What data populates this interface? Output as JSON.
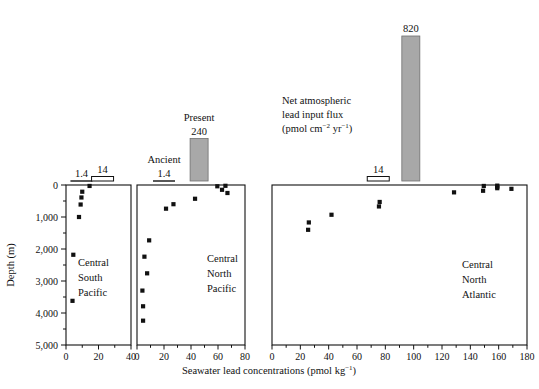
{
  "figure": {
    "y_axis_label": "Depth (m)",
    "x_axis_label_main": "Seawater lead concentrations (pmol kg",
    "x_axis_label_sup": "−1",
    "x_axis_label_tail": ")",
    "flux_caption_line1": "Net atmospheric",
    "flux_caption_line2": "lead input flux",
    "flux_caption_line3_pre": "(pmol cm",
    "flux_caption_sup1": "−2",
    "flux_caption_line3_mid": " yr",
    "flux_caption_sup2": "−1",
    "flux_caption_line3_end": ")",
    "legend_present": "Present",
    "legend_ancient": "Ancient",
    "depth_ticks": [
      "0",
      "1,000",
      "2,000",
      "3,000",
      "4,000",
      "5,000"
    ],
    "depth_values": [
      0,
      1000,
      2000,
      3000,
      4000,
      5000
    ],
    "depth_minor_values": [
      500,
      1500,
      2500,
      3500,
      4500
    ],
    "colors": {
      "bar_fill_present": "#a8a8a8",
      "bar_fill_ancient": "#ffffff",
      "axis": "#111111",
      "marker": "#111111",
      "background": "#ffffff"
    }
  },
  "chart_data": {
    "type": "scatter",
    "title": "",
    "ylabel": "Depth (m)",
    "xlabel": "Seawater lead concentrations (pmol kg−1)",
    "ylim": [
      0,
      5000
    ],
    "y_inverted": true,
    "grid": false,
    "legend": "none",
    "panels": [
      {
        "name": "Central South Pacific",
        "label_lines": [
          "Central",
          "South",
          "Pacific"
        ],
        "xlim": [
          0,
          40
        ],
        "xticks": [
          0,
          20,
          40
        ],
        "xtick_labels": [
          "0",
          "20",
          "40"
        ],
        "x_minor": [
          10,
          30
        ],
        "points": [
          {
            "x": 14.5,
            "y": 30
          },
          {
            "x": 10.0,
            "y": 210
          },
          {
            "x": 9.5,
            "y": 390
          },
          {
            "x": 9.0,
            "y": 610
          },
          {
            "x": 8.0,
            "y": 1000
          },
          {
            "x": 4.5,
            "y": 2180
          },
          {
            "x": 4.0,
            "y": 3620
          }
        ],
        "flux_bars": [
          {
            "label": "1.4",
            "value": 1.4,
            "style": "line",
            "x_center": 9.5
          },
          {
            "label": "14",
            "value": 14,
            "style": "hatched",
            "x_center": 22.5
          }
        ]
      },
      {
        "name": "Central North Pacific",
        "label_lines": [
          "Central",
          "North",
          "Pacific"
        ],
        "xlim": [
          0,
          80
        ],
        "xticks": [
          0,
          20,
          40,
          60,
          80
        ],
        "xtick_labels": [
          "0",
          "20",
          "40",
          "60",
          "80"
        ],
        "x_minor": [
          10,
          30,
          50,
          70
        ],
        "points": [
          {
            "x": 59.5,
            "y": 40
          },
          {
            "x": 65.5,
            "y": 25
          },
          {
            "x": 63.0,
            "y": 150
          },
          {
            "x": 67.0,
            "y": 250
          },
          {
            "x": 43.0,
            "y": 430
          },
          {
            "x": 27.0,
            "y": 600
          },
          {
            "x": 21.5,
            "y": 740
          },
          {
            "x": 9.0,
            "y": 1730
          },
          {
            "x": 5.5,
            "y": 2240
          },
          {
            "x": 7.5,
            "y": 2760
          },
          {
            "x": 4.0,
            "y": 3300
          },
          {
            "x": 4.5,
            "y": 3790
          },
          {
            "x": 4.5,
            "y": 4240
          }
        ],
        "flux_bars": [
          {
            "label": "1.4",
            "value": 1.4,
            "style": "line",
            "x_center": 20.0,
            "caption": "Ancient"
          },
          {
            "label": "240",
            "value": 240,
            "style": "filled",
            "x_center": 46.0,
            "caption": "Present"
          }
        ]
      },
      {
        "name": "Central North Atlantic",
        "label_lines": [
          "Central",
          "North",
          "Atlantic"
        ],
        "xlim": [
          0,
          180
        ],
        "xticks": [
          0,
          20,
          40,
          60,
          80,
          100,
          120,
          140,
          160,
          180
        ],
        "xtick_labels": [
          "0",
          "20",
          "40",
          "60",
          "80",
          "100",
          "120",
          "140",
          "160",
          "180"
        ],
        "x_minor": [
          10,
          30,
          50,
          70,
          90,
          110,
          130,
          150,
          170
        ],
        "points": [
          {
            "x": 159.0,
            "y": 20
          },
          {
            "x": 159.0,
            "y": 60
          },
          {
            "x": 159.0,
            "y": 100
          },
          {
            "x": 149.5,
            "y": 30
          },
          {
            "x": 169.0,
            "y": 120
          },
          {
            "x": 149.0,
            "y": 180
          },
          {
            "x": 128.5,
            "y": 230
          },
          {
            "x": 76.0,
            "y": 530
          },
          {
            "x": 75.5,
            "y": 670
          },
          {
            "x": 42.0,
            "y": 930
          },
          {
            "x": 26.0,
            "y": 1170
          },
          {
            "x": 25.5,
            "y": 1400
          }
        ],
        "flux_bars": [
          {
            "label": "14",
            "value": 14,
            "style": "outline",
            "x_center": 75.0
          },
          {
            "label": "820",
            "value": 820,
            "style": "filled",
            "x_center": 98.0
          }
        ]
      }
    ]
  }
}
